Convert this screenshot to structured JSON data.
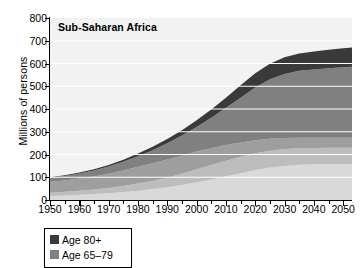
{
  "chart_data": {
    "type": "area",
    "stacked": true,
    "title": "Sub-Saharan Africa",
    "xlabel": "",
    "ylabel": "Millions of persons",
    "xlim": [
      1950,
      2053
    ],
    "ylim": [
      0,
      800
    ],
    "ytick_step": 100,
    "xtick_step": 10,
    "xminor_step": 5,
    "grid": "horizontal white gridlines at each 100",
    "gridline_color": "#ffffff",
    "plot_background": "#f2f2f2",
    "legend_position": "below-axes-left",
    "yticks": [
      0,
      100,
      200,
      300,
      400,
      500,
      600,
      700,
      800
    ],
    "xticks": [
      1950,
      1960,
      1970,
      1980,
      1990,
      2000,
      2010,
      2020,
      2030,
      2040,
      2050
    ],
    "x": [
      1950,
      1955,
      1960,
      1965,
      1970,
      1975,
      1980,
      1985,
      1990,
      1995,
      2000,
      2005,
      2010,
      2015,
      2020,
      2025,
      2030,
      2035,
      2040,
      2045,
      2050,
      2053
    ],
    "series": [
      {
        "name": "band-1-bottom",
        "color": "#d9d9d9",
        "values": [
          18,
          20,
          23,
          26,
          30,
          35,
          41,
          48,
          56,
          66,
          78,
          90,
          104,
          118,
          132,
          143,
          150,
          155,
          157,
          158,
          158,
          158
        ]
      },
      {
        "name": "band-2",
        "color": "#bdbdbd",
        "values": [
          14,
          16,
          18,
          20,
          23,
          27,
          31,
          36,
          42,
          49,
          57,
          64,
          69,
          72,
          74,
          74,
          74,
          73,
          72,
          72,
          72,
          72
        ]
      },
      {
        "name": "band-3",
        "color": "#9e9e9e",
        "values": [
          48,
          50,
          53,
          57,
          62,
          68,
          74,
          78,
          80,
          80,
          78,
          74,
          69,
          63,
          57,
          52,
          48,
          46,
          45,
          44,
          44,
          44
        ]
      },
      {
        "name": "Age 65-79",
        "color": "#808080",
        "values": [
          18,
          20,
          23,
          27,
          32,
          38,
          46,
          57,
          71,
          88,
          108,
          133,
          163,
          197,
          232,
          262,
          282,
          294,
          300,
          305,
          310,
          312
        ]
      },
      {
        "name": "Age 80+",
        "color": "#3a3a3a",
        "values": [
          2,
          3,
          4,
          5,
          7,
          9,
          12,
          15,
          19,
          24,
          30,
          37,
          45,
          54,
          62,
          68,
          73,
          76,
          79,
          81,
          83,
          84
        ]
      }
    ],
    "totals": [
      100,
      109,
      121,
      135,
      154,
      177,
      204,
      234,
      268,
      307,
      351,
      398,
      450,
      504,
      557,
      599,
      627,
      644,
      653,
      660,
      667,
      670
    ],
    "legend": [
      {
        "label": "Age 80+",
        "color": "#3a3a3a"
      },
      {
        "label": "Age 65-79",
        "color": "#808080"
      }
    ]
  },
  "axis": {
    "y_title": "Millions of persons",
    "y_labels": [
      "800",
      "700",
      "600",
      "500",
      "400",
      "300",
      "200",
      "100",
      "0"
    ],
    "x_labels": [
      "1950",
      "1960",
      "1970",
      "1980",
      "1990",
      "2000",
      "2010",
      "2020",
      "2030",
      "2040",
      "2050"
    ]
  },
  "title": {
    "text": "Sub-Saharan Africa"
  },
  "legend": {
    "items": [
      {
        "label": "Age 80+"
      },
      {
        "label": "Age 65–79"
      }
    ]
  }
}
